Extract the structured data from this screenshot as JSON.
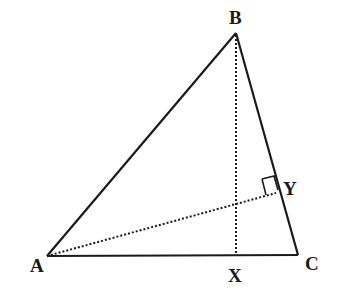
{
  "diagram": {
    "type": "triangle-with-altitudes",
    "points": {
      "A": {
        "label": "A",
        "x": 47,
        "y": 256,
        "label_x": 30,
        "label_y": 272
      },
      "B": {
        "label": "B",
        "x": 236,
        "y": 33,
        "label_x": 229,
        "label_y": 24
      },
      "C": {
        "label": "C",
        "x": 298,
        "y": 255,
        "label_x": 305,
        "label_y": 270
      },
      "X": {
        "label": "X",
        "x": 236,
        "y": 256,
        "label_x": 228,
        "label_y": 282
      },
      "Y": {
        "label": "Y",
        "x": 276,
        "y": 193,
        "label_x": 283,
        "label_y": 195
      }
    },
    "solid_segments": [
      {
        "from": "A",
        "to": "B"
      },
      {
        "from": "B",
        "to": "C"
      },
      {
        "from": "A",
        "to": "C"
      }
    ],
    "dotted_segments": [
      {
        "from": "B",
        "to": "X",
        "meaning": "altitude from B to AC"
      },
      {
        "from": "A",
        "to": "Y",
        "meaning": "altitude from A to BC"
      }
    ],
    "right_angle_markers": [
      {
        "at": "Y"
      }
    ],
    "colors": {
      "line": "#1a1a1a",
      "background": "#ffffff"
    }
  }
}
